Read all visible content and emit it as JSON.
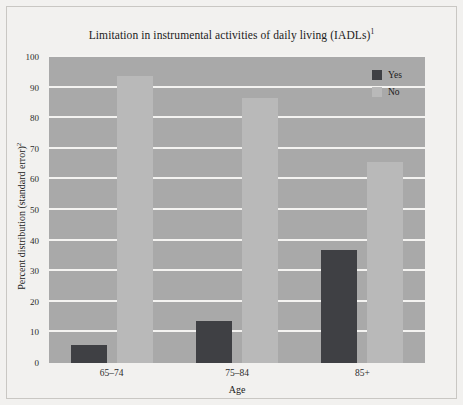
{
  "chart_data": {
    "type": "bar",
    "title": "Limitation in instrumental activities of daily living (IADLs)",
    "title_superscript": "1",
    "xlabel": "Age",
    "ylabel": "Percent distribution (standard error)",
    "ylabel_superscript": "2",
    "categories": [
      "65–74",
      "75–84",
      "85+"
    ],
    "series": [
      {
        "name": "Yes",
        "color": "#3f4044",
        "values": [
          5.8,
          13.7,
          36.8
        ]
      },
      {
        "name": "No",
        "color": "#b9b9b9",
        "values": [
          93.8,
          86.5,
          65.6
        ]
      }
    ],
    "ylim": [
      0,
      100
    ],
    "yticks": [
      0,
      10,
      20,
      30,
      40,
      50,
      60,
      70,
      80,
      90,
      100
    ],
    "ytick_labels": [
      "0",
      "10",
      "20",
      "30",
      "40",
      "50",
      "60",
      "70",
      "80",
      "90",
      "100"
    ],
    "grid": true,
    "grid_color": "#f4f3f1",
    "legend_position": "top-right",
    "plot_background": "#a9a9a9",
    "figure_background": "#f2f1ef"
  }
}
